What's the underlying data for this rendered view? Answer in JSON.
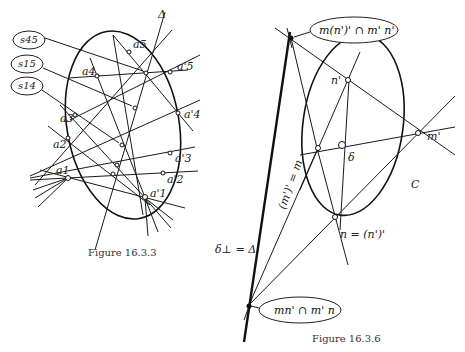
{
  "figure_left": {
    "caption": "Figure 16.3.3",
    "axis_label": "Δ",
    "callouts": [
      "s45",
      "s15",
      "s14"
    ],
    "points": {
      "a1": "a1",
      "a2": "a2",
      "a3": "a3",
      "a4": "a4",
      "a5": "a5",
      "a1p": "a'1",
      "a2p": "a'2",
      "a3p": "a'3",
      "a4p": "a'4",
      "a5p": "a'5"
    }
  },
  "figure_right": {
    "caption": "Figure 16.3.6",
    "callout_top": "m(n')' ∩ m' n'",
    "callout_bottom": "mn' ∩ m' n",
    "points": {
      "n_prime": "n'",
      "m_prime": "m'",
      "delta": "δ",
      "conic": "C",
      "n_eq": "n = (n')'",
      "m_eq": "(m')' = m",
      "polar": "δ⊥ = Δ"
    }
  }
}
